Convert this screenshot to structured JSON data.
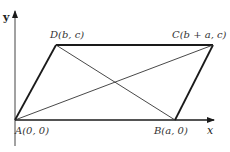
{
  "figure": {
    "type": "parallelogram-coordinate-diagram",
    "axes": {
      "x_label": "x",
      "y_label": "y"
    },
    "points": [
      {
        "id": "A",
        "label": "A(0, 0)"
      },
      {
        "id": "B",
        "label": "B(a, 0)"
      },
      {
        "id": "C",
        "label": "C(b + a, c)"
      },
      {
        "id": "D",
        "label": "D(b, c)"
      }
    ],
    "edges": [
      "AB",
      "BC",
      "CD",
      "DA"
    ],
    "diagonals": [
      "AC",
      "BD"
    ],
    "colors": {
      "stroke": "#1a1a1a",
      "thin_stroke": "#333333",
      "text": "#333333",
      "background": "#ffffff"
    }
  }
}
